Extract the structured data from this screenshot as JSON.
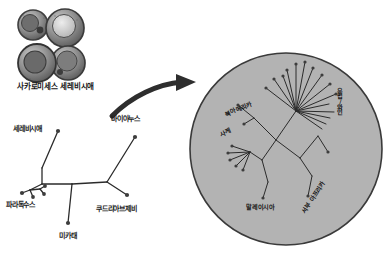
{
  "figure": {
    "title": "",
    "background_color": "#ffffff",
    "width": 386,
    "height": 254
  },
  "colors": {
    "ink": "#1b1b1b",
    "cell_fill": "#8d8d8d",
    "cell_dark": "#4a4a4a",
    "cell_light": "#d8d8d8",
    "circle_fill": "#b3b3b3",
    "circle_stroke": "#3a3a3a",
    "branch": "#2b2b2b",
    "node": "#3d3d3d",
    "arrow": "#2e2e2e"
  },
  "micrograph": {
    "caption": "사카로미세스 세레비시애",
    "icon": "yeast-cells-micrograph",
    "cell_count": 4
  },
  "arrow": {
    "icon": "curved-arrow-right",
    "direction": "right"
  },
  "species_tree": {
    "name": "saccharomyces-species-tree",
    "type": "unrooted-phylogram",
    "tips": [
      {
        "label": "세레비시애",
        "x": 13,
        "y": 129,
        "node_x": 58,
        "node_y": 131
      },
      {
        "label": "바이아누스",
        "x": 112,
        "y": 119,
        "node_x": 135,
        "node_y": 137
      },
      {
        "label": "파라독수스",
        "x": 6,
        "y": 203,
        "node_x": 22,
        "node_y": 193
      },
      {
        "label": "쿠드리아브제비",
        "x": 97,
        "y": 207,
        "node_x": 127,
        "node_y": 195
      },
      {
        "label": "미카태",
        "x": 59,
        "y": 234,
        "node_x": 68,
        "node_y": 223
      }
    ]
  },
  "population_circle": {
    "name": "cerevisiae-population-tree",
    "type": "unrooted-radial-tree",
    "center_x": 286,
    "center_y": 149,
    "radius": 96,
    "clades": [
      {
        "label": "북아메리카",
        "x": 224,
        "y": 112,
        "rotation": -22
      },
      {
        "label": "사케",
        "x": 219,
        "y": 132,
        "rotation": -22
      },
      {
        "label": "유럽/와인",
        "x": 339,
        "y": 88,
        "orientation": "vertical"
      },
      {
        "label": "말레이시아",
        "x": 246,
        "y": 204,
        "rotation": 0
      },
      {
        "label": "서부 아프리카",
        "x": 301,
        "y": 209,
        "rotation": -57
      }
    ]
  }
}
